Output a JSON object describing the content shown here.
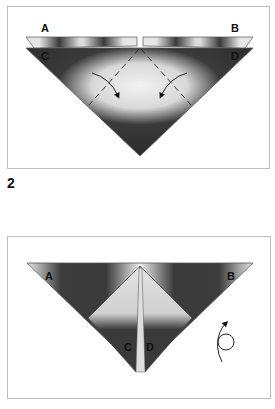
{
  "diagram": {
    "type": "origami-instructions",
    "steps": [
      {
        "panel": 1,
        "labels": [
          "A",
          "B",
          "C",
          "D"
        ],
        "fold_arrows": 2,
        "dashed_fold_lines": 2
      },
      {
        "panel": 2,
        "step_number": "2",
        "labels": [
          "A",
          "B",
          "C",
          "D"
        ],
        "turn_over_symbol": true
      }
    ],
    "colors": {
      "paper_dark": "#3a3a3a",
      "paper_light": "#e8e8e8",
      "border": "#bdbdbd"
    }
  },
  "labels": {
    "step_number": "2",
    "p1_a": "A",
    "p1_b": "B",
    "p1_c": "C",
    "p1_d": "D",
    "p2_a": "A",
    "p2_b": "B",
    "p2_c": "C",
    "p2_d": "D"
  }
}
